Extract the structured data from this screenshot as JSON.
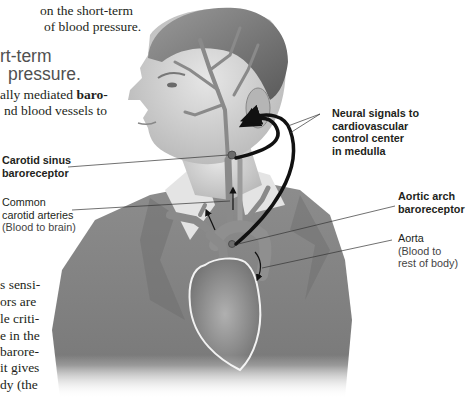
{
  "top_text": {
    "lines": [
      "on the short-term",
      "of blood pressure."
    ]
  },
  "heading": {
    "lines": [
      "rt-term",
      "pressure."
    ]
  },
  "intro_text": {
    "line1_prefix": "ally mediated ",
    "line1_bold": "baro-",
    "line2": "nd blood vessels to"
  },
  "lower_text": {
    "lines": [
      "s sensi-",
      "ors  are",
      "le criti-",
      "e in the",
      "barore-",
      "it gives",
      "dy  (the"
    ]
  },
  "figure": {
    "labels": {
      "neural_signals": [
        "Neural signals to",
        "cardiovascular",
        "control center",
        "in medulla"
      ],
      "carotid_sinus": [
        "Carotid sinus",
        "baroreceptor"
      ],
      "common_carotid": [
        "Common",
        "carotid arteries",
        "(Blood to brain)"
      ],
      "aortic_arch": [
        "Aortic arch",
        "baroreceptor"
      ],
      "aorta": [
        "Aorta",
        "(Blood to",
        "rest of body)"
      ]
    },
    "colors": {
      "vessel": "#8a8a8a",
      "receptor_dot": "#6b6b6b",
      "arrow": "#111111",
      "label_line": "#333333"
    }
  }
}
